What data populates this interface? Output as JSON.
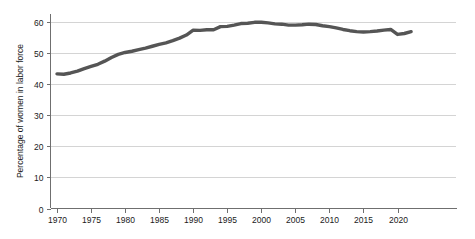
{
  "chart_data": {
    "type": "line",
    "title": "",
    "xlabel": "",
    "ylabel": "Percentage of women in labor force",
    "xlim": [
      1969,
      2023
    ],
    "ylim": [
      0,
      63
    ],
    "grid": true,
    "legend": "none",
    "y_ticks": [
      0,
      10,
      20,
      30,
      40,
      50,
      60
    ],
    "y_tick_labels": [
      "0",
      "10",
      "20",
      "30",
      "40",
      "50",
      "60"
    ],
    "x_ticks": [
      1970,
      1975,
      1980,
      1985,
      1990,
      1995,
      2000,
      2005,
      2010,
      2015,
      2020
    ],
    "x_tick_labels": [
      "1970",
      "1975",
      "1980",
      "1985",
      "1990",
      "1995",
      "2000",
      "2005",
      "2010",
      "2015",
      "2020"
    ],
    "series": [
      {
        "name": "Percentage of women in labor force",
        "color": "#555555",
        "x": [
          1970,
          1971,
          1972,
          1973,
          1974,
          1975,
          1976,
          1977,
          1978,
          1979,
          1980,
          1981,
          1982,
          1983,
          1984,
          1985,
          1986,
          1987,
          1988,
          1989,
          1990,
          1991,
          1992,
          1993,
          1994,
          1995,
          1996,
          1997,
          1998,
          1999,
          2000,
          2001,
          2002,
          2003,
          2004,
          2005,
          2006,
          2007,
          2008,
          2009,
          2010,
          2011,
          2012,
          2013,
          2014,
          2015,
          2016,
          2017,
          2018,
          2019,
          2020,
          2021,
          2022
        ],
        "values": [
          43.3,
          43.2,
          43.6,
          44.2,
          45.0,
          45.7,
          46.4,
          47.4,
          48.6,
          49.6,
          50.2,
          50.6,
          51.1,
          51.6,
          52.2,
          52.8,
          53.3,
          54.0,
          54.8,
          55.8,
          57.4,
          57.3,
          57.5,
          57.5,
          58.5,
          58.6,
          59.0,
          59.5,
          59.6,
          59.9,
          59.9,
          59.7,
          59.4,
          59.3,
          59.0,
          59.0,
          59.1,
          59.3,
          59.2,
          58.8,
          58.5,
          58.1,
          57.6,
          57.2,
          56.9,
          56.8,
          56.9,
          57.1,
          57.4,
          57.6,
          56.0,
          56.3,
          56.9
        ]
      }
    ]
  },
  "axes": {
    "y_axis_name": "y-axis",
    "x_axis_name": "x-axis"
  }
}
